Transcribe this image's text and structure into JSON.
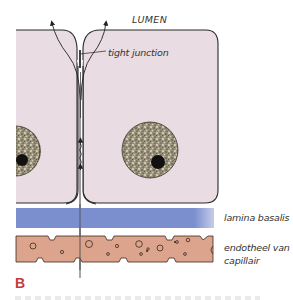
{
  "figure": {
    "panel_label": "B",
    "labels": {
      "lumen": "LUMEN",
      "tight_junction": "tight junction",
      "lamina_basalis": "lamina basalis",
      "endothelium_line1": "endotheel van",
      "endothelium_line2": "capillair"
    },
    "structures": [
      "epithelial-cell-left",
      "epithelial-cell-right",
      "nucleus-left",
      "nucleus-right",
      "paracellular-pathway",
      "tight-junction",
      "lamina-basalis",
      "capillary-endothelium"
    ],
    "colors": {
      "cytoplasm": "#e9dce3",
      "cell_outline": "#2b2b2b",
      "nucleus": "#8c8470",
      "nucleolus": "#111111",
      "lamina_basalis": "#7b8fce",
      "endothelium": "#dca48c",
      "panel_label": "#c23a3a",
      "label_text": "#333333"
    }
  }
}
